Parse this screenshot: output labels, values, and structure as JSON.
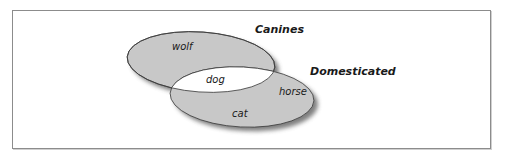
{
  "diagram": {
    "type": "venn",
    "sets": [
      {
        "id": "canines",
        "label": "Canines"
      },
      {
        "id": "domesticated",
        "label": "Domesticated"
      }
    ],
    "items": [
      {
        "label": "wolf",
        "region": "canines-only"
      },
      {
        "label": "dog",
        "region": "intersection"
      },
      {
        "label": "horse",
        "region": "domesticated-only"
      },
      {
        "label": "cat",
        "region": "domesticated-only"
      }
    ],
    "colors": {
      "fill": "#c8c8c8",
      "intersection": "#ffffff",
      "stroke": "#3a3a3a",
      "shadow": "#5a5a5a",
      "frame": "#8c8c8c"
    }
  }
}
